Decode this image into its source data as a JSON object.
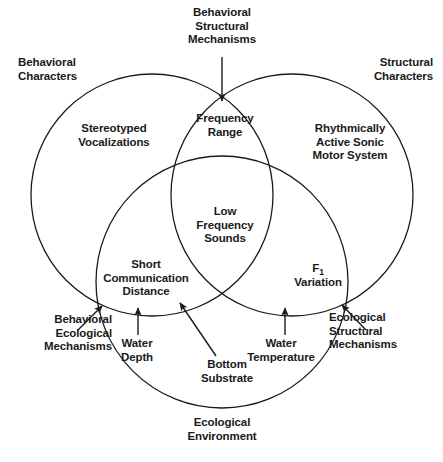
{
  "figure": {
    "type": "venn-diagram-3-circle",
    "background_color": "#ffffff",
    "stroke_color": "#1a1a1a",
    "text_color": "#1a1a1a"
  },
  "circles": {
    "behavioral_characters": {
      "label": "Behavioral\nCharacters",
      "cx": 152,
      "cy": 195,
      "r": 121
    },
    "structural_characters": {
      "label": "Structural\nCharacters",
      "cx": 292,
      "cy": 195,
      "r": 121
    },
    "ecological_environment": {
      "label": "Ecological\nEnvironment",
      "cx": 222,
      "cy": 282,
      "r": 126
    }
  },
  "outer_labels": {
    "behavioral_characters": "Behavioral\nCharacters",
    "structural_characters": "Structural\nCharacters",
    "behavioral_structural_mechanisms": "Behavioral\nStructural\nMechanisms",
    "behavioral_ecological_mechanisms": "Behavioral\nEcological\nMechanisms",
    "ecological_structural_mechanisms": "Ecological\nStructural\nMechanisms",
    "ecological_environment": "Ecological\nEnvironment"
  },
  "region_labels": {
    "behavioral_only": "Stereotyped\nVocalizations",
    "structural_only": "Rhythmically\nActive Sonic\nMotor System",
    "behavioral_structural": "Frequency\nRange",
    "center_all_three": "Low\nFrequency\nSounds",
    "behavioral_ecological": "Short\nCommunication\nDistance",
    "ecological_structural_main": "F",
    "ecological_structural_subscript": "1",
    "ecological_structural_rest": "\nVariation"
  },
  "annotations": [
    {
      "name": "water-depth",
      "text": "Water\nDepth",
      "arrow": "vertical-up"
    },
    {
      "name": "bottom-substrate",
      "text": "Bottom\nSubstrate",
      "arrow": "diagonal-up-left"
    },
    {
      "name": "water-temperature",
      "text": "Water\nTemperature",
      "arrow": "vertical-up"
    }
  ]
}
